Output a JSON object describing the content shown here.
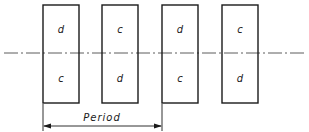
{
  "diagram": {
    "center_line": {
      "y": 53,
      "x1": 4,
      "x2": 305,
      "style": "dash-dot"
    },
    "blocks": [
      {
        "x": 43,
        "top_label": "d",
        "bottom_label": "c"
      },
      {
        "x": 102,
        "top_label": "c",
        "bottom_label": "d"
      },
      {
        "x": 162,
        "top_label": "d",
        "bottom_label": "c"
      },
      {
        "x": 222,
        "top_label": "c",
        "bottom_label": "d"
      }
    ],
    "block_width": 36,
    "block_top": 5,
    "block_bottom": 103,
    "period": {
      "label": "Period",
      "x1": 43,
      "x2": 162,
      "y": 126
    },
    "stroke_color": "#1a1a1a"
  }
}
